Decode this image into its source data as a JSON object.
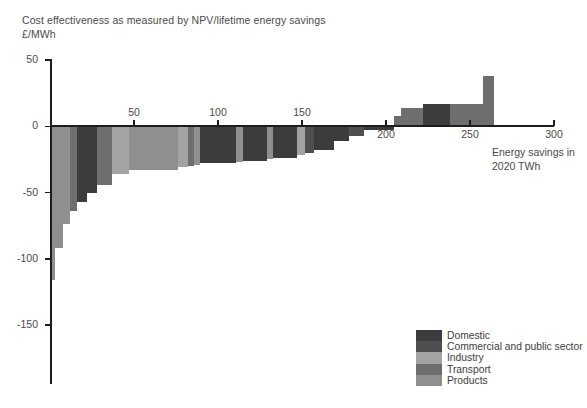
{
  "title": {
    "line1": "Cost effectiveness as measured by NPV/lifetime energy savings",
    "line2": "£/MWh"
  },
  "annotation": {
    "line1": "Energy savings in",
    "line2": "2020 TWh"
  },
  "legend": {
    "items": [
      {
        "label": "Domestic",
        "color": "#3c3c3c"
      },
      {
        "label": "Commercial and public sector",
        "color": "#4f4f4f"
      },
      {
        "label": "Industry",
        "color": "#a3a3a3"
      },
      {
        "label": "Transport",
        "color": "#6e6e6e"
      },
      {
        "label": "Products",
        "color": "#8f8f8f"
      }
    ]
  },
  "chart_data": {
    "type": "bar",
    "subtype": "marginal-abatement-cost-curve",
    "title": "Cost effectiveness as measured by NPV/lifetime energy savings",
    "xlabel": "Energy savings in 2020 TWh",
    "ylabel": "£/MWh",
    "xlim": [
      0,
      300
    ],
    "ylim": [
      -150,
      50
    ],
    "xticks": [
      50,
      100,
      150,
      200,
      250,
      300
    ],
    "yticks": [
      50,
      0,
      -50,
      -100,
      -150
    ],
    "grid": false,
    "legend_position": "bottom-right",
    "x_units": "TWh",
    "y_units": "£/MWh",
    "series": [
      {
        "name": "Domestic",
        "color": "#3c3c3c"
      },
      {
        "name": "Commercial and public sector",
        "color": "#4f4f4f"
      },
      {
        "name": "Industry",
        "color": "#a3a3a3"
      },
      {
        "name": "Transport",
        "color": "#6e6e6e"
      },
      {
        "name": "Products",
        "color": "#8f8f8f"
      }
    ],
    "bars": [
      {
        "x0": 0,
        "width": 3,
        "value": -116,
        "sector": "Products"
      },
      {
        "x0": 3,
        "width": 5,
        "value": -92,
        "sector": "Products"
      },
      {
        "x0": 8,
        "width": 4,
        "value": -74,
        "sector": "Products"
      },
      {
        "x0": 12,
        "width": 4,
        "value": -64,
        "sector": "Transport"
      },
      {
        "x0": 16,
        "width": 6,
        "value": -57,
        "sector": "Domestic"
      },
      {
        "x0": 22,
        "width": 6,
        "value": -50,
        "sector": "Domestic"
      },
      {
        "x0": 28,
        "width": 9,
        "value": -44,
        "sector": "Transport"
      },
      {
        "x0": 37,
        "width": 10,
        "value": -36,
        "sector": "Industry"
      },
      {
        "x0": 47,
        "width": 29,
        "value": -33,
        "sector": "Products"
      },
      {
        "x0": 76,
        "width": 6,
        "value": -31,
        "sector": "Industry"
      },
      {
        "x0": 82,
        "width": 4,
        "value": -30,
        "sector": "Transport"
      },
      {
        "x0": 86,
        "width": 3,
        "value": -29,
        "sector": "Products"
      },
      {
        "x0": 89,
        "width": 22,
        "value": -28,
        "sector": "Domestic"
      },
      {
        "x0": 111,
        "width": 4,
        "value": -27,
        "sector": "Products"
      },
      {
        "x0": 115,
        "width": 14,
        "value": -26,
        "sector": "Domestic"
      },
      {
        "x0": 129,
        "width": 4,
        "value": -25,
        "sector": "Products"
      },
      {
        "x0": 133,
        "width": 14,
        "value": -24,
        "sector": "Domestic"
      },
      {
        "x0": 147,
        "width": 5,
        "value": -22,
        "sector": "Industry"
      },
      {
        "x0": 152,
        "width": 5,
        "value": -20,
        "sector": "Commercial and public sector"
      },
      {
        "x0": 157,
        "width": 12,
        "value": -18,
        "sector": "Domestic"
      },
      {
        "x0": 169,
        "width": 9,
        "value": -11,
        "sector": "Domestic"
      },
      {
        "x0": 178,
        "width": 9,
        "value": -7,
        "sector": "Commercial and public sector"
      },
      {
        "x0": 187,
        "width": 18,
        "value": -3,
        "sector": "Domestic"
      },
      {
        "x0": 205,
        "width": 4,
        "value": 8,
        "sector": "Transport"
      },
      {
        "x0": 209,
        "width": 13,
        "value": 14,
        "sector": "Transport"
      },
      {
        "x0": 222,
        "width": 16,
        "value": 17,
        "sector": "Domestic"
      },
      {
        "x0": 238,
        "width": 20,
        "value": 17,
        "sector": "Transport"
      },
      {
        "x0": 258,
        "width": 6,
        "value": 38,
        "sector": "Transport"
      }
    ]
  }
}
